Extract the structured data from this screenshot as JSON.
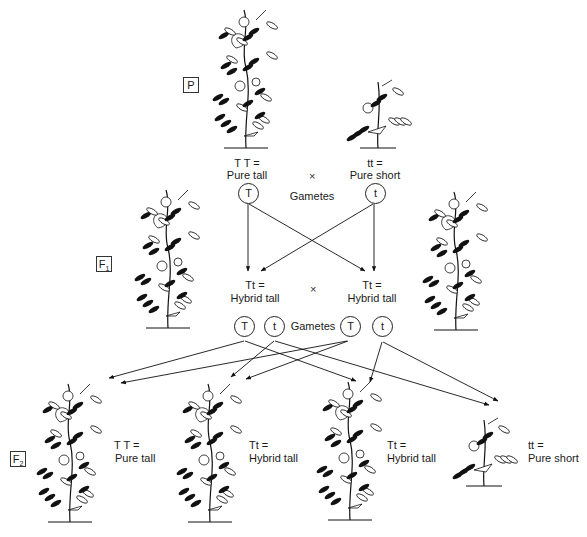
{
  "diagram": {
    "generations": {
      "P": {
        "label": "P",
        "sub": ""
      },
      "F1": {
        "label": "F",
        "sub": "1"
      },
      "F2": {
        "label": "F",
        "sub": "2"
      }
    },
    "parents": {
      "left": {
        "genotype": "T T =",
        "phenotype": "Pure tall",
        "plant": "tall-pea-plant"
      },
      "right": {
        "genotype": "tt =",
        "phenotype": "Pure short",
        "plant": "short-pea-plant"
      },
      "cross_symbol": "×",
      "gametes_label": "Gametes",
      "gametes": [
        "T",
        "t"
      ]
    },
    "f1": {
      "left": {
        "genotype": "Tt =",
        "phenotype": "Hybrid tall"
      },
      "right": {
        "genotype": "Tt =",
        "phenotype": "Hybrid tall"
      },
      "cross_symbol": "×",
      "gametes_label": "Gametes",
      "gametes": [
        "T",
        "t",
        "T",
        "t"
      ]
    },
    "f2": [
      {
        "genotype": "T T =",
        "phenotype": "Pure tall",
        "plant": "tall-pea-plant"
      },
      {
        "genotype": "Tt =",
        "phenotype": "Hybrid tall",
        "plant": "tall-pea-plant"
      },
      {
        "genotype": "Tt =",
        "phenotype": "Hybrid tall",
        "plant": "tall-pea-plant"
      },
      {
        "genotype": "tt =",
        "phenotype": "Pure short",
        "plant": "short-pea-plant"
      }
    ]
  }
}
